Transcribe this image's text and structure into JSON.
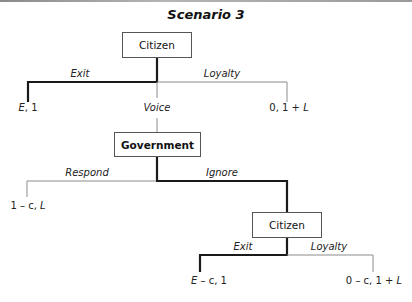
{
  "title": "Scenario 3",
  "nodes": {
    "citizen_1": "Citizen",
    "government": "Government",
    "citizen_2": "Citizen"
  },
  "branches": {
    "citizen_1": {
      "exit": "Exit",
      "voice": "Voice",
      "loyalty": "Loyalty"
    },
    "government": {
      "respond": "Respond",
      "ignore": "Ignore"
    },
    "citizen_2": {
      "exit": "Exit",
      "loyalty": "Loyalty"
    }
  },
  "payoffs": {
    "exit_1": [
      "E",
      ", 1"
    ],
    "loyalty_1": [
      "0, 1 + ",
      "L"
    ],
    "respond": [
      "1 – c, ",
      "L"
    ],
    "exit_2": [
      "E",
      " – c, 1"
    ],
    "loyalty_2": [
      "0 – c, 1 + ",
      "L"
    ]
  },
  "equilibrium_path": [
    "Exit (Citizen, first move) ",
    "Ignore (Government)",
    "Exit (Citizen, second move)"
  ],
  "colors": {
    "thick_line": "#1a1a1a",
    "thin_line": "#8c8c8c",
    "box_border": "#555555"
  }
}
